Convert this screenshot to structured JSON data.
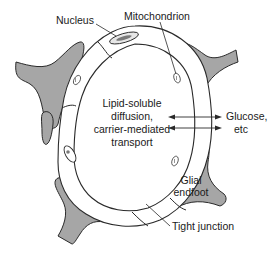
{
  "diagram": {
    "type": "anatomical-cross-section",
    "labels": {
      "nucleus": "Nucleus",
      "mitochondrion": "Mitochondrion",
      "center_line1": "Lipid-soluble",
      "center_line2": "diffusion,",
      "center_line3": "carrier-mediated",
      "center_line4": "transport",
      "glucose_line1": "Glucose,",
      "glucose_line2": "etc",
      "glial_line1": "Glial",
      "glial_line2": "endfoot",
      "tight_junction": "Tight junction"
    },
    "colors": {
      "endfoot_fill": "#a6a6a6",
      "stroke": "#2a2a2a",
      "background": "#ffffff",
      "nucleus_fill": "#d9d9d9",
      "nucleus_core": "#7a7a7a"
    }
  }
}
